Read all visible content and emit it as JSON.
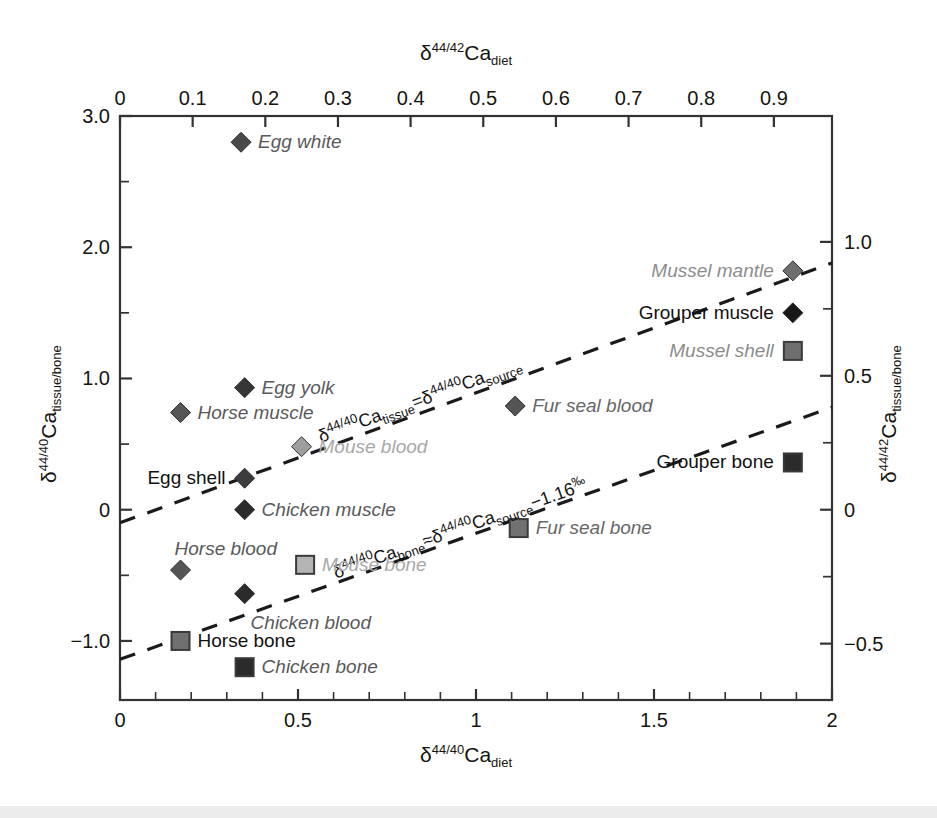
{
  "figure": {
    "background": "#ffffff",
    "frame_color": "#333333"
  },
  "chart_data": {
    "type": "scatter",
    "title": "",
    "top_xlabel": "δ⁴⁴ᐟ⁴²Ca_diet",
    "bottom_xlabel": "δ⁴⁴ᐟ⁴⁰Ca_diet",
    "left_ylabel": "δ⁴⁴ᐟ⁴⁰Ca_tissue/bone",
    "right_ylabel": "δ⁴⁴ᐟ⁴²Ca_tissue/bone",
    "xlim": [
      0,
      2
    ],
    "ylim": [
      -1.45,
      3.0
    ],
    "grid": false,
    "legend": "none",
    "axes": {
      "bottom": {
        "label_prefix": "δ",
        "label_sup": "44/40",
        "label_mid": "Ca",
        "label_sub": "diet",
        "major_ticks": [
          0,
          0.5,
          1,
          1.5,
          2
        ],
        "major_tick_labels": [
          "0",
          "0.5",
          "1",
          "1.5",
          "2"
        ],
        "minor_tick_step": 0.1
      },
      "top": {
        "label_prefix": "δ",
        "label_sup": "44/42",
        "label_mid": "Ca",
        "label_sub": "diet",
        "major_ticks": [
          0,
          0.1,
          0.2,
          0.3,
          0.4,
          0.5,
          0.6,
          0.7,
          0.8,
          0.9
        ],
        "major_tick_labels": [
          "0",
          "0.1",
          "0.2",
          "0.3",
          "0.4",
          "0.5",
          "0.6",
          "0.7",
          "0.8",
          "0.9"
        ],
        "scale_factor_vs_bottom": 0.49
      },
      "left": {
        "label_prefix": "δ",
        "label_sup": "44/40",
        "label_mid": "Ca",
        "label_sub": "tissue/bone",
        "major_ticks": [
          3.0,
          2.0,
          1.0,
          0,
          -1.0
        ],
        "major_tick_labels": [
          "3.0",
          "2.0",
          "1.0",
          "0",
          "−1.0"
        ],
        "minor_ticks": [
          2.5,
          1.5,
          0.5,
          -0.5
        ]
      },
      "right": {
        "label_prefix": "δ",
        "label_sup": "44/42",
        "label_mid": "Ca",
        "label_sub": "tissue/bone",
        "major_ticks": [
          1.0,
          0.5,
          0,
          -0.5
        ],
        "major_tick_labels": [
          "1.0",
          "0.5",
          "0",
          "−0.5"
        ],
        "scale_factor_vs_left": 0.49
      }
    },
    "points": [
      {
        "label": "Egg white",
        "x": 0.34,
        "y": 2.8,
        "marker": "diamond",
        "fill": "#4a4a4a",
        "label_side": "right",
        "label_color": "#595959",
        "italic": true
      },
      {
        "label": "Mussel mantle",
        "x": 1.89,
        "y": 1.82,
        "marker": "diamond",
        "fill": "#6e6e6e",
        "label_side": "left",
        "label_color": "#8c8c8c",
        "italic": true
      },
      {
        "label": "Grouper muscle",
        "x": 1.89,
        "y": 1.5,
        "marker": "diamond",
        "fill": "#171717",
        "label_side": "left",
        "label_color": "#111111",
        "italic": false
      },
      {
        "label": "Mussel shell",
        "x": 1.89,
        "y": 1.21,
        "marker": "square",
        "fill": "#6e6e6e",
        "label_side": "left",
        "label_color": "#8c8c8c",
        "italic": true
      },
      {
        "label": "Egg yolk",
        "x": 0.35,
        "y": 0.93,
        "marker": "diamond",
        "fill": "#363636",
        "label_side": "right",
        "label_color": "#595959",
        "italic": true
      },
      {
        "label": "Fur seal blood",
        "x": 1.11,
        "y": 0.79,
        "marker": "diamond",
        "fill": "#555555",
        "label_side": "right",
        "label_color": "#666666",
        "italic": true
      },
      {
        "label": "Horse muscle",
        "x": 0.17,
        "y": 0.74,
        "marker": "diamond",
        "fill": "#555555",
        "label_side": "right",
        "label_color": "#595959",
        "italic": true
      },
      {
        "label": "Mouse blood",
        "x": 0.51,
        "y": 0.48,
        "marker": "diamond",
        "fill": "#9e9e9e",
        "label_side": "right",
        "label_color": "#a8a8a8",
        "italic": true
      },
      {
        "label": "Egg shell",
        "x": 0.35,
        "y": 0.24,
        "marker": "diamond",
        "fill": "#3c3c3c",
        "label_side": "left",
        "label_color": "#111111",
        "italic": false
      },
      {
        "label": "Chicken muscle",
        "x": 0.35,
        "y": 0.0,
        "marker": "diamond",
        "fill": "#2b2b2b",
        "label_side": "right",
        "label_color": "#595959",
        "italic": true
      },
      {
        "label": "Grouper bone",
        "x": 1.89,
        "y": 0.36,
        "marker": "square",
        "fill": "#2b2b2b",
        "label_side": "left",
        "label_color": "#111111",
        "italic": false
      },
      {
        "label": "Fur seal bone",
        "x": 1.12,
        "y": -0.14,
        "marker": "square",
        "fill": "#717171",
        "label_side": "right",
        "label_color": "#666666",
        "italic": true
      },
      {
        "label": "Mouse bone",
        "x": 0.52,
        "y": -0.42,
        "marker": "square",
        "fill": "#b4b4b4",
        "label_side": "right",
        "label_color": "#a8a8a8",
        "italic": true
      },
      {
        "label": "Horse blood",
        "x": 0.17,
        "y": -0.46,
        "marker": "diamond",
        "fill": "#555555",
        "label_side": "above",
        "label_color": "#595959",
        "italic": true
      },
      {
        "label": "Chicken blood",
        "x": 0.35,
        "y": -0.64,
        "marker": "diamond",
        "fill": "#2b2b2b",
        "label_side": "below",
        "label_color": "#595959",
        "italic": true
      },
      {
        "label": "Horse bone",
        "x": 0.17,
        "y": -1.0,
        "marker": "square",
        "fill": "#707070",
        "label_side": "right",
        "label_color": "#111111",
        "italic": false
      },
      {
        "label": "Chicken bone",
        "x": 0.35,
        "y": -1.2,
        "marker": "square",
        "fill": "#2b2b2b",
        "label_side": "right",
        "label_color": "#595959",
        "italic": true
      }
    ],
    "trend_lines": [
      {
        "name": "tissue-equals-source",
        "equation_text": "δ⁴⁴ᐟ⁴⁰Ca_tissue = δ⁴⁴ᐟ⁴⁰Ca_source",
        "parts": {
          "d1": "δ",
          "sup1": "44/40",
          "mid1": "Ca",
          "sub1": "tissue",
          "eq": "=",
          "d2": "δ",
          "sup2": "44/40",
          "mid2": "Ca",
          "sub2": "source"
        },
        "x0": 0.0,
        "y0": -0.1,
        "x1": 2.0,
        "y1": 1.88,
        "style": "dashed"
      },
      {
        "name": "bone-approx-source-minus-1.16",
        "equation_text": "δ⁴⁴ᐟ⁴⁰Ca_bone ≈ δ⁴⁴ᐟ⁴⁰Ca_source −1.16‰",
        "parts": {
          "d1": "δ",
          "sup1": "44/40",
          "mid1": "Ca",
          "sub1": "bone",
          "eq": "≈",
          "d2": "δ",
          "sup2": "44/40",
          "mid2": "Ca",
          "sub2": "source",
          "tail": "−1.16",
          "permil": "‰"
        },
        "x0": 0.0,
        "y0": -1.14,
        "x1": 2.0,
        "y1": 0.78,
        "style": "dashed"
      }
    ]
  }
}
